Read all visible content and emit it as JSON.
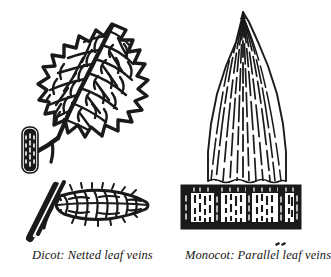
{
  "figure": {
    "title_visible": false,
    "background_color": "#ffffff",
    "ink_color": "#1a1a1a",
    "panels": [
      {
        "id": "dicot",
        "caption": "Dicot: Netted leaf veins",
        "parts": [
          "toothed-leaf-blade",
          "netted-vein-network",
          "petiole",
          "stem-segment-upper",
          "stem-segment-lower",
          "edge-view-leaf"
        ]
      },
      {
        "id": "monocot",
        "caption": "Monocot: Parallel leaf veins",
        "parts": [
          "pointed-leaf-blade",
          "parallel-vein-lines",
          "leaf-sheath-band",
          "sheath-striations"
        ]
      }
    ]
  },
  "captions": {
    "dicot": "Dicot: Netted leaf veins",
    "monocot": "Monocot: Parallel leaf veins"
  },
  "marks": {
    "artifact_speck": ""
  }
}
